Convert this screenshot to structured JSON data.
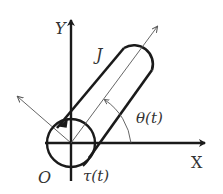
{
  "diagram": {
    "type": "rotating-rod-physics-diagram",
    "labels": {
      "y_axis": "Y",
      "x_axis": "X",
      "origin": "O",
      "inertia": "J",
      "angle": "θ(t)",
      "torque": "τ(t)"
    },
    "colors": {
      "stroke": "#1a1a1a",
      "thin_stroke": "#555555",
      "text": "#333333",
      "background": "#ffffff"
    }
  }
}
